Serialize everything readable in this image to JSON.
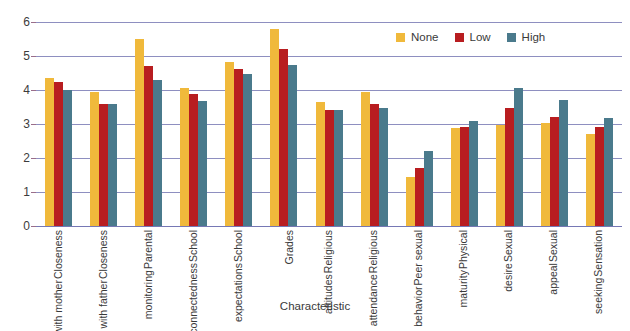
{
  "chart_data": {
    "type": "bar",
    "title": "",
    "xlabel": "Characteristic",
    "ylabel": "",
    "ylim": [
      0,
      6
    ],
    "yticks": [
      0,
      1,
      2,
      3,
      4,
      5,
      6
    ],
    "grid": true,
    "legend_position": "top-right",
    "categories": [
      "Closeness with mother",
      "Closeness with father",
      "Parental monitoring",
      "School connectedness",
      "School expectations",
      "Grades",
      "Religious attitudes",
      "Religious attendance",
      "Peer sexual behavior",
      "Physical maturity",
      "Sexual desire",
      "Sexual appeal",
      "Sensation seeking"
    ],
    "category_lines": [
      [
        "Closeness",
        "with mother"
      ],
      [
        "Closeness",
        "with father"
      ],
      [
        "Parental",
        "monitoring"
      ],
      [
        "School",
        "connectedness"
      ],
      [
        "School",
        "expectations"
      ],
      [
        "Grades"
      ],
      [
        "Religious",
        "attitudes"
      ],
      [
        "Religious",
        "attendance"
      ],
      [
        "Peer sexual",
        "behavior"
      ],
      [
        "Physical",
        "maturity"
      ],
      [
        "Sexual",
        "desire"
      ],
      [
        "Sexual",
        "appeal"
      ],
      [
        "Sensation",
        "seeking"
      ]
    ],
    "series": [
      {
        "name": "None",
        "color": "#f0b93b",
        "values": [
          4.35,
          3.93,
          5.5,
          4.05,
          4.82,
          5.78,
          3.65,
          3.95,
          1.45,
          2.88,
          2.98,
          3.02,
          2.7
        ]
      },
      {
        "name": "Low",
        "color": "#b81d20",
        "values": [
          4.25,
          3.6,
          4.7,
          3.87,
          4.62,
          5.2,
          3.4,
          3.6,
          1.72,
          2.92,
          3.47,
          3.22,
          2.9
        ]
      },
      {
        "name": "High",
        "color": "#4a7a8c",
        "values": [
          4.0,
          3.58,
          4.3,
          3.67,
          4.47,
          4.75,
          3.4,
          3.47,
          2.22,
          3.1,
          4.07,
          3.7,
          3.18
        ]
      }
    ]
  },
  "legend": {
    "items": [
      {
        "label": "None",
        "color": "#f0b93b"
      },
      {
        "label": "Low",
        "color": "#b81d20"
      },
      {
        "label": "High",
        "color": "#4a7a8c"
      }
    ]
  },
  "axis": {
    "x_title": "Characteristic"
  }
}
